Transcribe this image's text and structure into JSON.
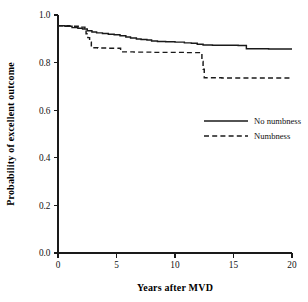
{
  "chart_data": {
    "type": "line",
    "title": "",
    "xlabel": "Years after MVD",
    "ylabel": "Probability of excellent outcome",
    "xlim": [
      0,
      20
    ],
    "ylim": [
      0.0,
      1.0
    ],
    "xticks": [
      0,
      5,
      10,
      15,
      20
    ],
    "xtick_labels": [
      "0",
      "5",
      "10",
      "15",
      "20"
    ],
    "yticks": [
      0.0,
      0.2,
      0.4,
      0.6,
      0.8,
      1.0
    ],
    "ytick_labels": [
      "0.0",
      "0.2",
      "0.4",
      "0.6",
      "0.8",
      "1.0"
    ],
    "grid": false,
    "legend_position": "center-right inside plot",
    "series": [
      {
        "name": "No numbness",
        "style": "solid",
        "color": "#1a1a1a",
        "points": [
          [
            0.0,
            0.955
          ],
          [
            0.6,
            0.953
          ],
          [
            1.2,
            0.947
          ],
          [
            1.7,
            0.944
          ],
          [
            2.1,
            0.941
          ],
          [
            2.5,
            0.934
          ],
          [
            2.9,
            0.929
          ],
          [
            3.3,
            0.925
          ],
          [
            3.8,
            0.922
          ],
          [
            4.3,
            0.919
          ],
          [
            4.8,
            0.917
          ],
          [
            5.3,
            0.913
          ],
          [
            5.8,
            0.908
          ],
          [
            6.2,
            0.903
          ],
          [
            6.7,
            0.899
          ],
          [
            7.1,
            0.897
          ],
          [
            7.6,
            0.895
          ],
          [
            8.0,
            0.891
          ],
          [
            8.5,
            0.889
          ],
          [
            9.2,
            0.888
          ],
          [
            10.0,
            0.886
          ],
          [
            10.8,
            0.883
          ],
          [
            11.4,
            0.881
          ],
          [
            11.9,
            0.877
          ],
          [
            12.4,
            0.874
          ],
          [
            13.2,
            0.873
          ],
          [
            14.3,
            0.873
          ],
          [
            15.4,
            0.872
          ],
          [
            16.0,
            0.872
          ],
          [
            16.1,
            0.858
          ],
          [
            18.0,
            0.857
          ],
          [
            20.0,
            0.857
          ]
        ]
      },
      {
        "name": "Numbness",
        "style": "dashed",
        "color": "#1a1a1a",
        "points": [
          [
            0.0,
            0.955
          ],
          [
            1.0,
            0.953
          ],
          [
            1.9,
            0.949
          ],
          [
            2.3,
            0.944
          ],
          [
            2.4,
            0.921
          ],
          [
            2.55,
            0.905
          ],
          [
            2.7,
            0.886
          ],
          [
            2.85,
            0.862
          ],
          [
            3.4,
            0.861
          ],
          [
            4.2,
            0.86
          ],
          [
            5.0,
            0.86
          ],
          [
            5.3,
            0.86
          ],
          [
            5.35,
            0.845
          ],
          [
            6.5,
            0.844
          ],
          [
            8.0,
            0.843
          ],
          [
            9.5,
            0.843
          ],
          [
            11.0,
            0.842
          ],
          [
            12.0,
            0.842
          ],
          [
            12.2,
            0.842
          ],
          [
            12.3,
            0.805
          ],
          [
            12.4,
            0.772
          ],
          [
            12.5,
            0.736
          ],
          [
            14.0,
            0.735
          ],
          [
            16.0,
            0.735
          ],
          [
            18.0,
            0.735
          ],
          [
            20.0,
            0.735
          ]
        ]
      }
    ]
  },
  "legend": {
    "entries": [
      {
        "label": "No numbness",
        "style": "solid"
      },
      {
        "label": "Numbness",
        "style": "dashed"
      }
    ]
  },
  "axes": {
    "x_title": "Years after MVD",
    "y_title": "Probability of excellent outcome"
  }
}
